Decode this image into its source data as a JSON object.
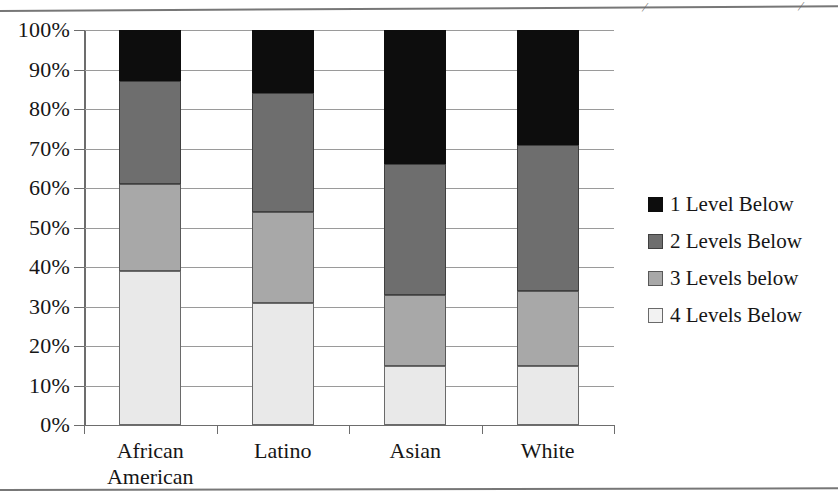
{
  "page": {
    "top_rule_descenders": [
      "⁄",
      "⁄"
    ]
  },
  "chart_data": {
    "type": "bar",
    "subtype": "stacked-100-percent",
    "title": "",
    "xlabel": "",
    "ylabel": "",
    "ylim": [
      0,
      100
    ],
    "ytick_labels": [
      "100%",
      "90%",
      "80%",
      "70%",
      "60%",
      "50%",
      "40%",
      "30%",
      "20%",
      "10%",
      "0%"
    ],
    "ytick_values": [
      100,
      90,
      80,
      70,
      60,
      50,
      40,
      30,
      20,
      10,
      0
    ],
    "grid": true,
    "legend_position": "right",
    "categories": [
      "African American",
      "Latino",
      "Asian",
      "White"
    ],
    "category_lines": [
      [
        "African",
        "American"
      ],
      [
        "Latino"
      ],
      [
        "Asian"
      ],
      [
        "White"
      ]
    ],
    "series": [
      {
        "name": "1 Level Below",
        "color": "#0d0d0d",
        "values": [
          13,
          16,
          34,
          29
        ]
      },
      {
        "name": "2 Levels Below",
        "color": "#6e6e6e",
        "values": [
          26,
          30,
          33,
          37
        ]
      },
      {
        "name": "3 Levels below",
        "color": "#a8a8a8",
        "values": [
          22,
          23,
          18,
          19
        ]
      },
      {
        "name": "4 Levels Below",
        "color": "#e9e9e9",
        "values": [
          39,
          31,
          15,
          15
        ]
      }
    ],
    "cumulative_tops": {
      "African American": {
        "4 Levels Below": 39,
        "3 Levels below": 61,
        "2 Levels Below": 87,
        "1 Level Below": 100
      },
      "Latino": {
        "4 Levels Below": 31,
        "3 Levels below": 54,
        "2 Levels Below": 84,
        "1 Level Below": 100
      },
      "Asian": {
        "4 Levels Below": 15,
        "3 Levels below": 33,
        "2 Levels Below": 66,
        "1 Level Below": 100
      },
      "White": {
        "4 Levels Below": 15,
        "3 Levels below": 34,
        "2 Levels Below": 71,
        "1 Level Below": 100
      }
    }
  }
}
